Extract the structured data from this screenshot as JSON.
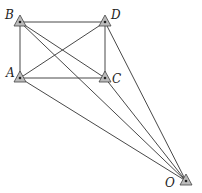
{
  "diagram": {
    "type": "geometry-survey",
    "points": [
      {
        "id": "B",
        "label": "B",
        "x": 20,
        "y": 22,
        "lx": 5,
        "ly": 19
      },
      {
        "id": "D",
        "label": "D",
        "x": 105,
        "y": 22,
        "lx": 111,
        "ly": 19
      },
      {
        "id": "A",
        "label": "A",
        "x": 20,
        "y": 78,
        "lx": 6,
        "ly": 77
      },
      {
        "id": "C",
        "label": "C",
        "x": 105,
        "y": 78,
        "lx": 112,
        "ly": 83
      },
      {
        "id": "O",
        "label": "O",
        "x": 186,
        "y": 181,
        "lx": 165,
        "ly": 187
      }
    ],
    "segments": [
      [
        "B",
        "D"
      ],
      [
        "A",
        "C"
      ],
      [
        "B",
        "A"
      ],
      [
        "D",
        "C"
      ],
      [
        "B",
        "C"
      ],
      [
        "A",
        "D"
      ],
      [
        "B",
        "O"
      ],
      [
        "D",
        "O"
      ],
      [
        "A",
        "O"
      ],
      [
        "C",
        "O"
      ]
    ],
    "colors": {
      "line": "#333333",
      "marker_fill": "#bbbbbb",
      "marker_stroke": "#444444"
    }
  }
}
